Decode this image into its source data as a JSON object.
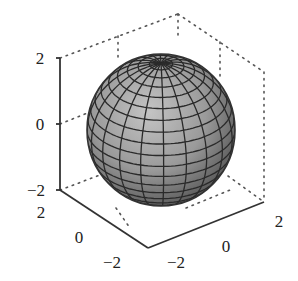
{
  "chart_data": {
    "type": "surface3d",
    "title": "",
    "surface": {
      "shape": "sphere",
      "center": [
        0,
        0,
        0
      ],
      "radius": 2,
      "meridians": 20,
      "parallels": 20,
      "shading": "grayscale"
    },
    "axes": {
      "x": {
        "label": "",
        "ticks": [
          -2,
          0,
          2
        ],
        "tick_labels": [
          "−2",
          "0",
          "2"
        ],
        "range": [
          -2,
          2
        ]
      },
      "y": {
        "label": "",
        "ticks": [
          -2,
          0,
          2
        ],
        "tick_labels": [
          "−2",
          "0",
          "2"
        ],
        "range": [
          -2,
          2
        ]
      },
      "z": {
        "label": "",
        "ticks": [
          -2,
          0,
          2
        ],
        "tick_labels": [
          "−2",
          "0",
          "2"
        ],
        "range": [
          -2,
          2
        ]
      }
    },
    "box": "dotted back edges",
    "grid": false,
    "legend": null
  },
  "ticks": {
    "z": [
      "2",
      "0",
      "−2"
    ],
    "y_left": [
      "2",
      "0",
      "−2"
    ],
    "x_right": [
      "−2",
      "0",
      "2"
    ]
  },
  "colors": {
    "axis": "#333333",
    "dotted": "#555555",
    "mesh_line": "#2a2a2a",
    "face_light": "#b8b8b8",
    "face_dark": "#5a5a5a"
  }
}
